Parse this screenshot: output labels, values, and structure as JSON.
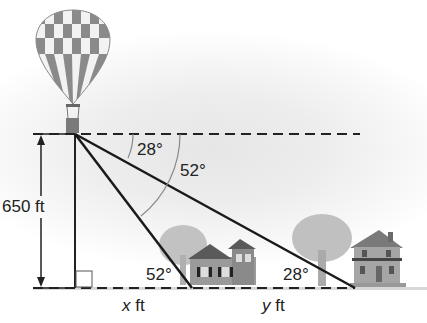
{
  "figure": {
    "labels": {
      "height": "650 ft",
      "angle_top_small": "28°",
      "angle_top_large": "52°",
      "angle_bottom_near": "52°",
      "angle_bottom_far": "28°",
      "x_var": "x",
      "y_var": "y",
      "unit": "ft"
    },
    "objects": [
      "hot-air-balloon",
      "house-near",
      "house-far",
      "tree-near",
      "tree-far"
    ],
    "colors": {
      "line": "#1a1a1a",
      "arc": "#888888",
      "house": "#707070",
      "tree": "#b5b5b5"
    }
  }
}
